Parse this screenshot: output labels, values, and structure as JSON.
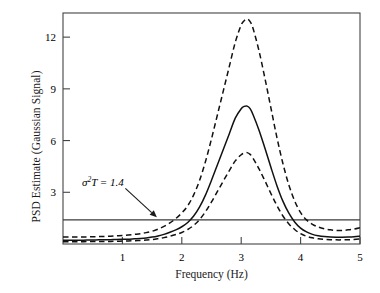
{
  "chart_data": {
    "type": "line",
    "title": "",
    "xlabel": "Frequency (Hz)",
    "ylabel": "PSD Estimate (Gaussian Signal)",
    "xlim": [
      0,
      5
    ],
    "ylim": [
      0,
      13.4
    ],
    "xticks": [
      1,
      2,
      3,
      4,
      5
    ],
    "xtick_labels": [
      "1",
      "2",
      "3",
      "4",
      "5"
    ],
    "yticks": [
      3,
      6,
      9,
      12
    ],
    "ytick_labels": [
      "3",
      "6",
      "9",
      "12"
    ],
    "grid": false,
    "legend": null,
    "reference_lines": [
      {
        "name": "sigma-squared-T",
        "orientation": "horizontal",
        "value": 1.4,
        "style": "solid",
        "label": "σ²T = 1.4",
        "label_base": "σ",
        "label_sup": "2",
        "label_rest": "T = 1.4"
      }
    ],
    "annotations": [
      {
        "name": "sigma-annotation",
        "text": "σ²T = 1.4",
        "x": 1.05,
        "y": 3.0,
        "arrow_to_x": 1.58,
        "arrow_to_y": 1.55
      }
    ],
    "x": [
      0.0,
      0.1,
      0.2,
      0.3,
      0.4,
      0.5,
      0.6,
      0.7,
      0.8,
      0.9,
      1.0,
      1.1,
      1.2,
      1.3,
      1.4,
      1.5,
      1.6,
      1.7,
      1.8,
      1.9,
      2.0,
      2.1,
      2.2,
      2.3,
      2.4,
      2.5,
      2.6,
      2.7,
      2.8,
      2.9,
      3.0,
      3.05,
      3.1,
      3.15,
      3.2,
      3.3,
      3.4,
      3.5,
      3.6,
      3.7,
      3.8,
      3.9,
      4.0,
      4.1,
      4.2,
      4.3,
      4.4,
      4.5,
      4.6,
      4.7,
      4.8,
      4.9,
      5.0
    ],
    "series": [
      {
        "name": "psd-estimate",
        "style": "solid",
        "label": "PSD estimate",
        "values": [
          0.22,
          0.22,
          0.22,
          0.22,
          0.23,
          0.23,
          0.24,
          0.24,
          0.25,
          0.26,
          0.27,
          0.28,
          0.3,
          0.32,
          0.35,
          0.4,
          0.47,
          0.56,
          0.68,
          0.82,
          1.0,
          1.25,
          1.62,
          2.15,
          2.85,
          3.7,
          4.6,
          5.5,
          6.4,
          7.3,
          7.85,
          7.98,
          8.0,
          7.85,
          7.5,
          6.6,
          5.55,
          4.45,
          3.4,
          2.5,
          1.8,
          1.28,
          0.92,
          0.7,
          0.56,
          0.48,
          0.43,
          0.4,
          0.39,
          0.39,
          0.4,
          0.42,
          0.46
        ]
      },
      {
        "name": "upper-confidence-bound",
        "style": "dashed",
        "label": "Upper confidence bound",
        "values": [
          0.4,
          0.4,
          0.4,
          0.41,
          0.41,
          0.42,
          0.43,
          0.44,
          0.45,
          0.47,
          0.49,
          0.52,
          0.56,
          0.6,
          0.66,
          0.74,
          0.86,
          1.02,
          1.22,
          1.48,
          1.8,
          2.22,
          2.85,
          3.7,
          4.8,
          6.1,
          7.5,
          8.9,
          10.3,
          11.7,
          12.7,
          12.95,
          13.05,
          12.9,
          12.5,
          11.2,
          9.6,
          7.9,
          6.2,
          4.7,
          3.45,
          2.5,
          1.82,
          1.4,
          1.14,
          0.98,
          0.88,
          0.82,
          0.79,
          0.79,
          0.82,
          0.87,
          0.95
        ]
      },
      {
        "name": "lower-confidence-bound",
        "style": "dashed",
        "label": "Lower confidence bound",
        "values": [
          0.13,
          0.13,
          0.13,
          0.13,
          0.14,
          0.14,
          0.14,
          0.15,
          0.15,
          0.16,
          0.17,
          0.18,
          0.19,
          0.21,
          0.23,
          0.26,
          0.31,
          0.37,
          0.45,
          0.55,
          0.67,
          0.84,
          1.08,
          1.42,
          1.88,
          2.44,
          3.05,
          3.66,
          4.25,
          4.82,
          5.18,
          5.27,
          5.3,
          5.2,
          4.97,
          4.36,
          3.66,
          2.93,
          2.24,
          1.64,
          1.18,
          0.84,
          0.6,
          0.45,
          0.36,
          0.3,
          0.27,
          0.25,
          0.24,
          0.24,
          0.25,
          0.26,
          0.29
        ]
      }
    ]
  }
}
